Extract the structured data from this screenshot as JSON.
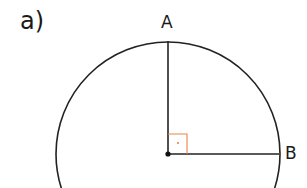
{
  "figure": {
    "part_label": "a)",
    "points": {
      "A": {
        "label": "A",
        "x": 168,
        "y": 40
      },
      "B": {
        "label": "B",
        "x": 279,
        "y": 154
      },
      "center": {
        "x": 168,
        "y": 154
      }
    },
    "circle": {
      "cx": 168,
      "cy": 154,
      "r": 112,
      "stroke": "#222222"
    },
    "right_angle_marker": {
      "size": 18,
      "color": "#e8834a"
    },
    "colors": {
      "line": "#222222",
      "marker": "#e8834a"
    }
  }
}
